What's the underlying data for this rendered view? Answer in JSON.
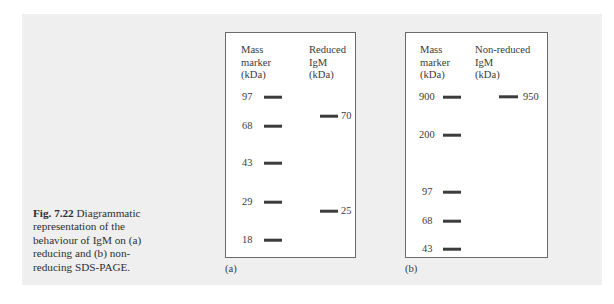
{
  "figure": {
    "caption_bold": "Fig. 7.22",
    "caption_text": "Diagrammatic representation of the behaviour of IgM on (a) reducing and (b) non-reducing SDS-PAGE.",
    "background_color": "#efefef",
    "band_color": "#3c3c3c"
  },
  "panels": [
    {
      "label": "(a)",
      "marker_header": "Mass\nmarker\n(kDa)",
      "sample_header": "Reduced\nIgM\n(kDa)",
      "marker_bands": [
        {
          "value": "97",
          "y": 64
        },
        {
          "value": "68",
          "y": 93
        },
        {
          "value": "43",
          "y": 130
        },
        {
          "value": "29",
          "y": 169
        },
        {
          "value": "18",
          "y": 207
        }
      ],
      "sample_bands": [
        {
          "value": "70",
          "y": 83
        },
        {
          "value": "25",
          "y": 178
        }
      ]
    },
    {
      "label": "(b)",
      "marker_header": "Mass\nmarker\n(kDa)",
      "sample_header": "Non-reduced\nIgM\n(kDa)",
      "marker_bands": [
        {
          "value": "900",
          "y": 64
        },
        {
          "value": "200",
          "y": 102
        },
        {
          "value": "97",
          "y": 159
        },
        {
          "value": "68",
          "y": 188
        },
        {
          "value": "43",
          "y": 216
        }
      ],
      "sample_bands": [
        {
          "value": "950",
          "y": 64
        }
      ]
    }
  ]
}
